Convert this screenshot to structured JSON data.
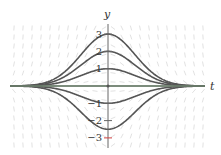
{
  "figure": {
    "type": "slope field with solution curves",
    "axes": {
      "x_label": "t",
      "y_label": "y",
      "y_ticks": [
        {
          "value": 3,
          "label": "3"
        },
        {
          "value": 2,
          "label": "2"
        },
        {
          "value": 1,
          "label": "1"
        },
        {
          "value": -1,
          "label": "−1"
        },
        {
          "value": -2,
          "label": "−2"
        },
        {
          "value": -3,
          "label": "−3"
        }
      ]
    },
    "solution_curves": [
      {
        "peak": 3
      },
      {
        "peak": 2
      },
      {
        "peak": 1
      },
      {
        "peak": 0
      },
      {
        "peak": -1
      },
      {
        "peak": -2.5
      }
    ],
    "colors": {
      "curve": "#555555",
      "axis": "#666666",
      "t_axis_tint": "#7a9a7a",
      "slope_marks": "#e2e2e2",
      "highlight_tick": "#d04040"
    }
  }
}
